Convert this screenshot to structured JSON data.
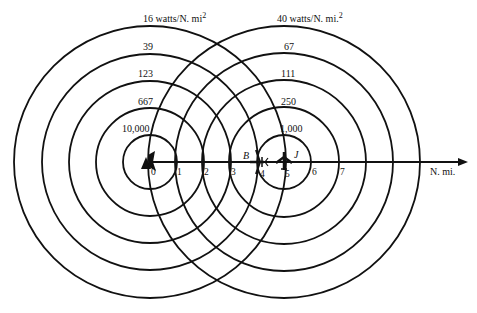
{
  "diagram": {
    "left_source": {
      "name": "radar",
      "center_x_nmi": 0,
      "contours": [
        {
          "label": "10,000",
          "unit_suffix": ""
        },
        {
          "label": "667",
          "unit_suffix": ""
        },
        {
          "label": "123",
          "unit_suffix": ""
        },
        {
          "label": "39",
          "unit_suffix": ""
        },
        {
          "label": "16 watts/N. mi",
          "unit_suffix": "2"
        }
      ]
    },
    "right_source": {
      "name": "jammer",
      "marker_label": "J",
      "center_x_nmi": 5,
      "contours": [
        {
          "label": "1,000",
          "unit_suffix": ""
        },
        {
          "label": "250",
          "unit_suffix": ""
        },
        {
          "label": "111",
          "unit_suffix": ""
        },
        {
          "label": "67",
          "unit_suffix": ""
        },
        {
          "label": "40 watts/N. mi.",
          "unit_suffix": "2"
        }
      ]
    },
    "bomber": {
      "marker_label": "B",
      "position_nmi": 4
    },
    "axis": {
      "unit_label": "N. mi.",
      "ticks": [
        "0",
        "1",
        "2",
        "3",
        "4",
        "5",
        "6",
        "7"
      ]
    },
    "colors": {
      "ink": "#111111",
      "background": "#ffffff"
    }
  }
}
